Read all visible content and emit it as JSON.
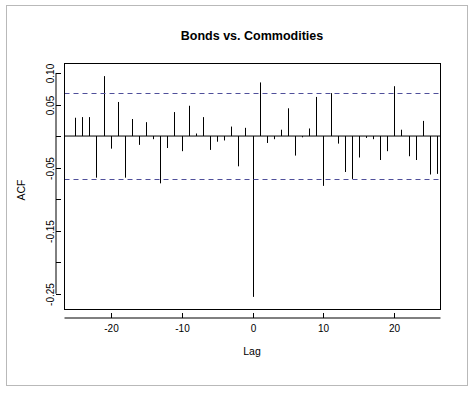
{
  "figure": {
    "background": "#ffffff",
    "border_color": "#b9b9b9",
    "title": "Bonds vs. Commodities",
    "xlabel": "Lag",
    "ylabel": "ACF"
  },
  "chart_data": {
    "type": "bar",
    "title": "Bonds vs. Commodities",
    "subtitle": "",
    "xlabel": "Lag",
    "ylabel": "ACF",
    "plot_style": "R cross-correlation (ccf) stick plot",
    "grid": false,
    "legend": null,
    "xlim": [
      -26.5,
      26.5
    ],
    "ylim": [
      -0.275,
      0.115
    ],
    "xticks": [
      -20,
      -10,
      0,
      10,
      20
    ],
    "xtick_labels": [
      "-20",
      "-10",
      "0",
      "10",
      "20"
    ],
    "yticks": [
      0.1,
      0.05,
      0.0,
      -0.05,
      -0.1,
      -0.15,
      -0.2,
      -0.25
    ],
    "ytick_labels": [
      "0.10",
      "0.05",
      "",
      "-0.05",
      "",
      "-0.15",
      "",
      "-0.25"
    ],
    "baseline": 0,
    "confidence_bounds": [
      0.068,
      -0.068
    ],
    "confidence_color": "#4f4f9a",
    "bar_color": "#000000",
    "x": [
      -26,
      -25,
      -24,
      -23,
      -22,
      -21,
      -20,
      -19,
      -18,
      -17,
      -16,
      -15,
      -14,
      -13,
      -12,
      -11,
      -10,
      -9,
      -8,
      -7,
      -6,
      -5,
      -4,
      -3,
      -2,
      -1,
      0,
      1,
      2,
      3,
      4,
      5,
      6,
      7,
      8,
      9,
      10,
      11,
      12,
      13,
      14,
      15,
      16,
      17,
      18,
      19,
      20,
      21,
      22,
      23,
      24,
      25,
      26
    ],
    "values": [
      0.0,
      0.029,
      0.03,
      0.03,
      -0.066,
      0.095,
      -0.02,
      0.054,
      -0.066,
      0.027,
      -0.014,
      0.022,
      -0.005,
      -0.075,
      -0.019,
      0.038,
      -0.024,
      0.048,
      0.004,
      0.03,
      -0.022,
      -0.009,
      -0.007,
      0.015,
      -0.048,
      0.013,
      -0.255,
      0.085,
      -0.011,
      -0.005,
      0.01,
      0.044,
      -0.031,
      -0.002,
      0.012,
      0.062,
      -0.079,
      0.068,
      -0.012,
      -0.057,
      -0.068,
      -0.034,
      -0.003,
      -0.005,
      -0.038,
      -0.024,
      0.079,
      0.01,
      -0.032,
      -0.038,
      0.024,
      -0.061,
      -0.06
    ]
  }
}
